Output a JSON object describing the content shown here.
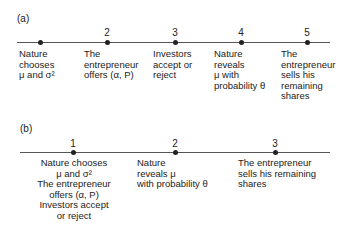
{
  "panel_a": {
    "label": "(a)",
    "events": [
      {
        "number": "",
        "text": "Nature\nchooses\nμ and σ²"
      },
      {
        "number": "2",
        "text": "The\nentrepreneur\noffers (α, P)"
      },
      {
        "number": "3",
        "text": "Investors\naccept or\nreject"
      },
      {
        "number": "4",
        "text": "Nature\nreveals\nμ with\nprobability θ"
      },
      {
        "number": "5",
        "text": "The\nentrepreneur\nsells his\nremaining\nshares"
      }
    ]
  },
  "panel_b": {
    "label": "(b)",
    "events": [
      {
        "number": "1",
        "text": "Nature chooses\nμ and σ²\nThe entrepreneur\noffers (α, P)\nInvestors accept\nor reject"
      },
      {
        "number": "2",
        "text": "Nature\nreveals μ\nwith probability θ"
      },
      {
        "number": "3",
        "text": "The entrepreneur\nsells his remaining\nshares"
      }
    ]
  }
}
